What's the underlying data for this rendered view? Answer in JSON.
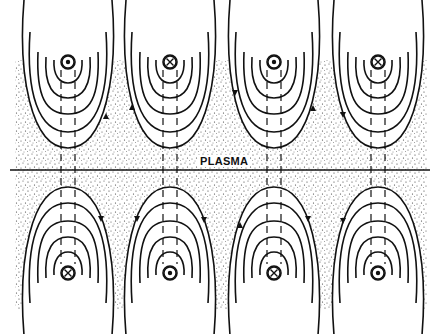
{
  "figure": {
    "label": "PLASMA",
    "colors": {
      "ink": "#111111",
      "background": "#ffffff",
      "stipple": "#333333"
    },
    "boundary_line": {
      "y": 170,
      "x1": 10,
      "x2": 430
    },
    "plasma_region": {
      "x": 15,
      "y": 60,
      "width": 412,
      "height": 250
    },
    "top_conductors": [
      {
        "cx": 68,
        "cy": 62,
        "symbol": "dot",
        "meaning": "current out of page"
      },
      {
        "cx": 170,
        "cy": 62,
        "symbol": "cross",
        "meaning": "current into page"
      },
      {
        "cx": 274,
        "cy": 62,
        "symbol": "dot",
        "meaning": "current out of page"
      },
      {
        "cx": 378,
        "cy": 62,
        "symbol": "cross",
        "meaning": "current into page"
      }
    ],
    "bottom_conductors": [
      {
        "cx": 68,
        "cy": 273,
        "symbol": "cross",
        "meaning": "current into page"
      },
      {
        "cx": 170,
        "cy": 273,
        "symbol": "dot",
        "meaning": "current out of page"
      },
      {
        "cx": 274,
        "cy": 273,
        "symbol": "cross",
        "meaning": "current into page"
      },
      {
        "cx": 378,
        "cy": 273,
        "symbol": "dot",
        "meaning": "current out of page"
      }
    ],
    "field_line_count_per_conductor": 5
  }
}
